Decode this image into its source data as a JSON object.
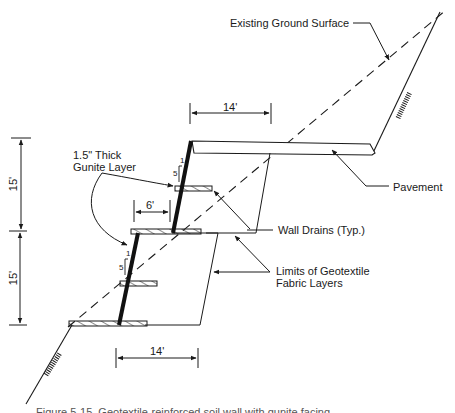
{
  "diagram": {
    "type": "geotechnical cross-section",
    "labels": {
      "existing_ground": "Existing Ground Surface",
      "gunite": "1.5\" Thick\nGunite Layer",
      "gunite_line1": "1.5\" Thick",
      "gunite_line2": "Gunite Layer",
      "pavement": "Pavement",
      "wall_drains": "Wall Drains (Typ.)",
      "geotextile_line1": "Limits of Geotextile",
      "geotextile_line2": "Fabric Layers"
    },
    "dimensions": {
      "top_width": "14'",
      "bench_offset": "6'",
      "bottom_width": "14'",
      "upper_height": "15'",
      "lower_height": "15'"
    },
    "batter": {
      "upper": {
        "rise": "5",
        "run": "1"
      },
      "lower": {
        "rise": "5",
        "run": "1"
      }
    },
    "caption": "Figure 5-15. Geotextile-reinforced soil wall with gunite facing"
  }
}
